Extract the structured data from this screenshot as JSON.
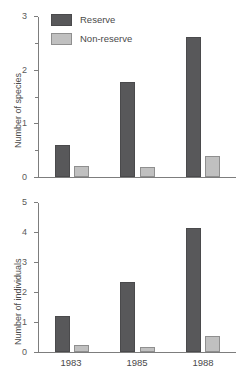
{
  "figure": {
    "background": "#ffffff",
    "series_colors": {
      "reserve": "#58585a",
      "non_reserve": "#c0c0c0"
    }
  },
  "legend": {
    "position": "top-left-inside-upper-panel",
    "entries": [
      {
        "label": "Reserve",
        "color": "#58585a",
        "swatch_name": "legend-swatch-reserve"
      },
      {
        "label": "Non-reserve",
        "color": "#c0c0c0",
        "swatch_name": "legend-swatch-non-reserve"
      }
    ]
  },
  "chart_data": [
    {
      "type": "bar",
      "panel": "upper",
      "title": "",
      "xlabel": "",
      "ylabel": "Number of species",
      "categories": [
        "1983",
        "1985",
        "1988"
      ],
      "ylim": [
        0,
        3
      ],
      "yticks": [
        0,
        1,
        2,
        3
      ],
      "ytick_labels": [
        "0",
        "1",
        "2",
        "3"
      ],
      "yminor_ticks": [
        0.5,
        1.5,
        2.5
      ],
      "grid": false,
      "legend_position": "upper left",
      "series": [
        {
          "name": "Reserve",
          "color": "#58585a",
          "values": [
            0.6,
            1.78,
            2.62
          ]
        },
        {
          "name": "Non-reserve",
          "color": "#c0c0c0",
          "values": [
            0.2,
            0.18,
            0.4
          ]
        }
      ]
    },
    {
      "type": "bar",
      "panel": "lower",
      "title": "",
      "xlabel": "",
      "ylabel": "Number of individuals",
      "categories": [
        "1983",
        "1985",
        "1988"
      ],
      "ylim": [
        0,
        5
      ],
      "yticks": [
        0,
        1,
        2,
        3,
        4,
        5
      ],
      "ytick_labels": [
        "0",
        "1",
        "2",
        "3",
        "4",
        "5"
      ],
      "yminor_ticks": [],
      "grid": false,
      "legend_position": "none",
      "series": [
        {
          "name": "Reserve",
          "color": "#58585a",
          "values": [
            1.2,
            2.35,
            4.15
          ]
        },
        {
          "name": "Non-reserve",
          "color": "#c0c0c0",
          "values": [
            0.22,
            0.18,
            0.55
          ]
        }
      ]
    }
  ]
}
